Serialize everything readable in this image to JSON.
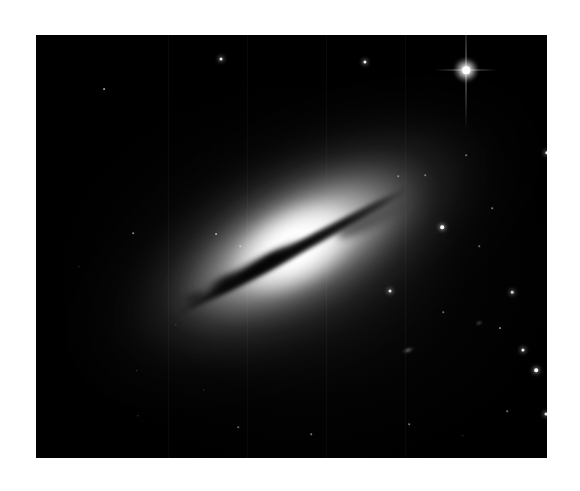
{
  "page": {
    "background_color": "#ffffff",
    "width": 580,
    "height": 491
  },
  "plate": {
    "name": "astronomical-image-plate",
    "left": 36,
    "top": 35,
    "width": 511,
    "height": 423,
    "background_color": "#000000",
    "caption": ""
  },
  "subject": {
    "type": "edge-on galaxy",
    "description": "Edge-on lenticular galaxy with a bright central bulge, extended smooth stellar halo and a narrow dark dust lane crossing the nucleus diagonally.",
    "position_angle_degrees": -28.5,
    "core_center_px": [
      310,
      275
    ],
    "halo_extent_px": [
      620,
      300
    ],
    "dust_lane": {
      "name": "dust-lane",
      "color": "#040404",
      "length_px": 268,
      "thickness_px": 11,
      "angle_degrees": -28.5
    },
    "bulge_color": "#ffffff",
    "halo_color": "#9a9a9a",
    "sky_color": "#000000"
  },
  "stars": [
    {
      "name": "bright-star-with-diffraction-spikes",
      "x": 466,
      "y": 70,
      "size": 7.5,
      "brightness": 1.0,
      "spikes": true
    },
    {
      "name": "field-star",
      "x": 221,
      "y": 59,
      "size": 3.0,
      "brightness": 0.92,
      "spikes": false
    },
    {
      "name": "field-star",
      "x": 365,
      "y": 62,
      "size": 3.2,
      "brightness": 0.95,
      "spikes": false
    },
    {
      "name": "field-star",
      "x": 104,
      "y": 89,
      "size": 1.8,
      "brightness": 0.6,
      "spikes": false
    },
    {
      "name": "field-star",
      "x": 547,
      "y": 153,
      "size": 3.4,
      "brightness": 0.95,
      "spikes": false
    },
    {
      "name": "field-star",
      "x": 442,
      "y": 227,
      "size": 3.6,
      "brightness": 1.0,
      "spikes": false
    },
    {
      "name": "field-star",
      "x": 133,
      "y": 233,
      "size": 1.6,
      "brightness": 0.5,
      "spikes": false
    },
    {
      "name": "field-star",
      "x": 216,
      "y": 234,
      "size": 1.8,
      "brightness": 0.55,
      "spikes": false
    },
    {
      "name": "field-star",
      "x": 240,
      "y": 246,
      "size": 1.5,
      "brightness": 0.45,
      "spikes": false
    },
    {
      "name": "field-star",
      "x": 390,
      "y": 291,
      "size": 3.0,
      "brightness": 0.9,
      "spikes": false
    },
    {
      "name": "field-star",
      "x": 512,
      "y": 292,
      "size": 2.6,
      "brightness": 0.8,
      "spikes": false
    },
    {
      "name": "field-star",
      "x": 523,
      "y": 350,
      "size": 3.2,
      "brightness": 0.95,
      "spikes": false
    },
    {
      "name": "field-star",
      "x": 536,
      "y": 370,
      "size": 3.6,
      "brightness": 1.0,
      "spikes": false
    },
    {
      "name": "field-star",
      "x": 500,
      "y": 328,
      "size": 1.8,
      "brightness": 0.5,
      "spikes": false
    },
    {
      "name": "field-star",
      "x": 546,
      "y": 414,
      "size": 3.0,
      "brightness": 0.9,
      "spikes": false
    },
    {
      "name": "field-star",
      "x": 507,
      "y": 411,
      "size": 1.6,
      "brightness": 0.45,
      "spikes": false
    },
    {
      "name": "field-star",
      "x": 409,
      "y": 424,
      "size": 1.6,
      "brightness": 0.45,
      "spikes": false
    },
    {
      "name": "field-star",
      "x": 463,
      "y": 436,
      "size": 1.4,
      "brightness": 0.4,
      "spikes": false
    },
    {
      "name": "field-star",
      "x": 311,
      "y": 434,
      "size": 1.6,
      "brightness": 0.45,
      "spikes": false
    },
    {
      "name": "field-star",
      "x": 238,
      "y": 427,
      "size": 1.5,
      "brightness": 0.4,
      "spikes": false
    },
    {
      "name": "field-star",
      "x": 138,
      "y": 416,
      "size": 1.4,
      "brightness": 0.38,
      "spikes": false
    },
    {
      "name": "field-star",
      "x": 137,
      "y": 371,
      "size": 1.4,
      "brightness": 0.38,
      "spikes": false
    },
    {
      "name": "field-star",
      "x": 204,
      "y": 390,
      "size": 1.4,
      "brightness": 0.35,
      "spikes": false
    },
    {
      "name": "field-star",
      "x": 176,
      "y": 325,
      "size": 1.4,
      "brightness": 0.35,
      "spikes": false
    },
    {
      "name": "field-star",
      "x": 466,
      "y": 155,
      "size": 1.6,
      "brightness": 0.42,
      "spikes": false
    },
    {
      "name": "field-star",
      "x": 425,
      "y": 175,
      "size": 1.5,
      "brightness": 0.4,
      "spikes": false
    },
    {
      "name": "field-star",
      "x": 398,
      "y": 176,
      "size": 1.5,
      "brightness": 0.4,
      "spikes": false
    },
    {
      "name": "field-star",
      "x": 492,
      "y": 208,
      "size": 1.6,
      "brightness": 0.45,
      "spikes": false
    },
    {
      "name": "field-star",
      "x": 479,
      "y": 246,
      "size": 1.5,
      "brightness": 0.4,
      "spikes": false
    },
    {
      "name": "field-star",
      "x": 443,
      "y": 312,
      "size": 1.5,
      "brightness": 0.4,
      "spikes": false
    },
    {
      "name": "field-star",
      "x": 79,
      "y": 267,
      "size": 1.4,
      "brightness": 0.35,
      "spikes": false
    }
  ],
  "background_galaxies": [
    {
      "name": "background-galaxy",
      "x": 408,
      "y": 350,
      "width": 13,
      "height": 4.5
    },
    {
      "name": "background-galaxy",
      "x": 479,
      "y": 323,
      "width": 8,
      "height": 3
    }
  ],
  "column_artifacts": [
    168,
    247,
    326,
    405
  ]
}
